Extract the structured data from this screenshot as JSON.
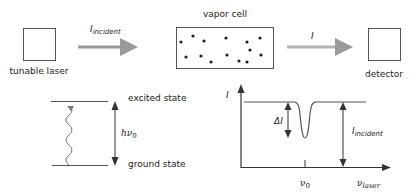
{
  "apparatus": {
    "laser_label": "tunable laser",
    "beam_in_label": "I",
    "beam_in_subscript": "incident",
    "cell_label": "vapor cell",
    "beam_out_label": "I",
    "detector_label": "detector",
    "arrow_color": "#9a9a9a",
    "outline_color": "#555555"
  },
  "energy_levels": {
    "upper_label": "excited state",
    "lower_label": "ground state",
    "transition_label": "hν",
    "transition_subscript": "0"
  },
  "absorption_plot": {
    "y_axis_label": "I",
    "dip_label": "ΔI",
    "reference_label": "I",
    "reference_subscript": "incident",
    "x_tick_label": "ν",
    "x_tick_subscript": "0",
    "x_axis_label": "ν",
    "x_axis_subscript": "laser"
  }
}
